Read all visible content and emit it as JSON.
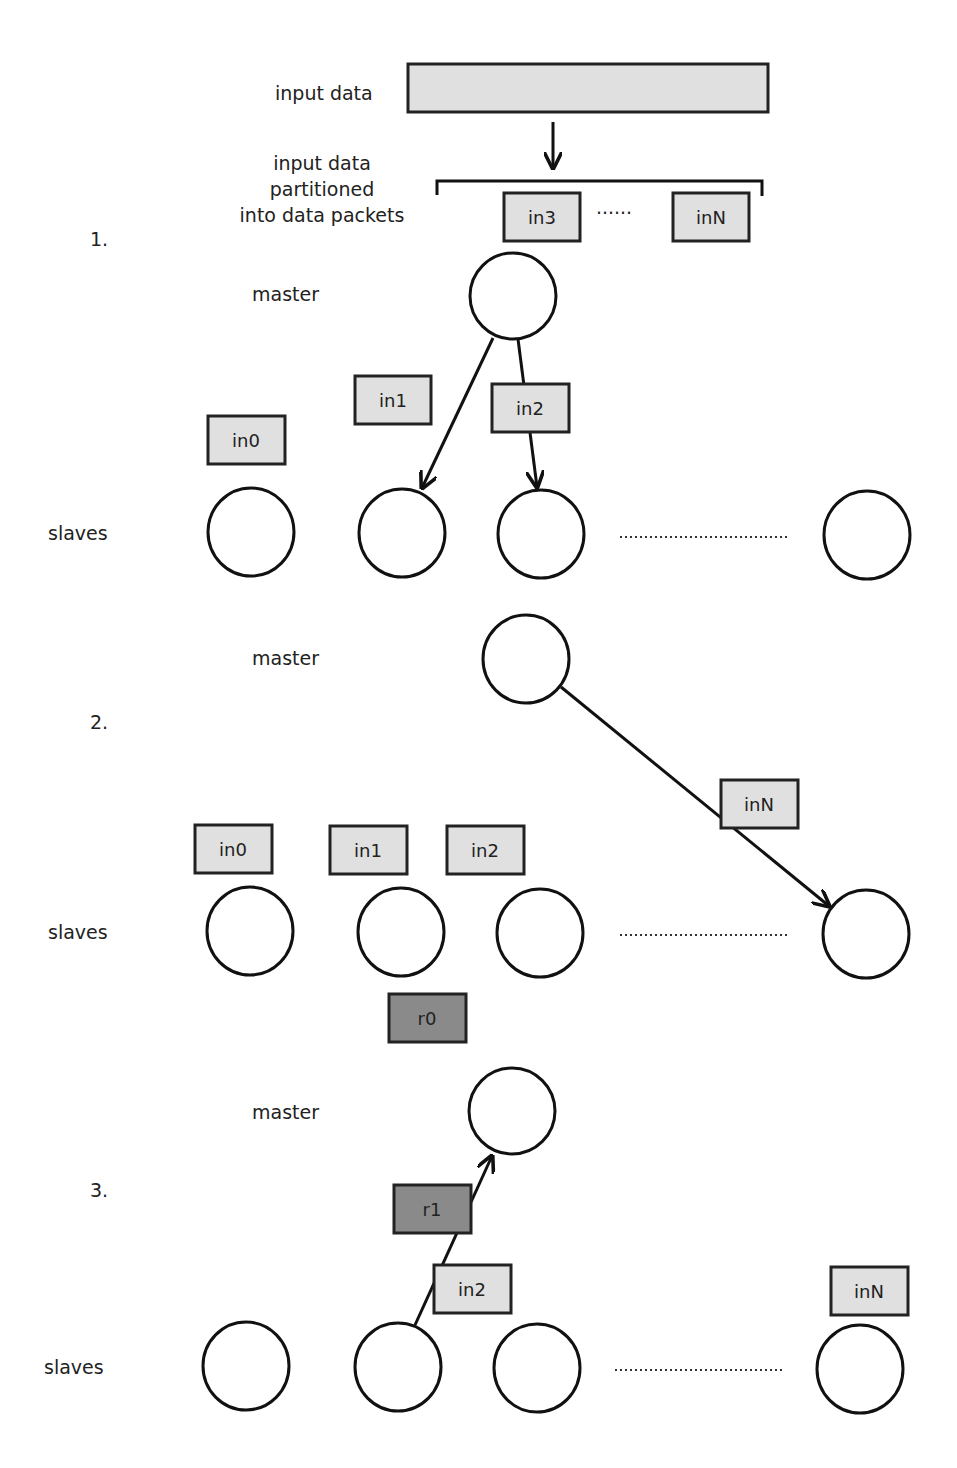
{
  "header": {
    "running_title": "master-slave"
  },
  "input": {
    "label": "input data",
    "partition_label_line1": "input data",
    "partition_label_line2": "partitioned",
    "partition_label_line3": "into data packets"
  },
  "colors": {
    "packet_fill": "#e0e0e0",
    "result_fill": "#8a8a8a",
    "stroke": "#222222"
  },
  "steps": [
    {
      "number": "1.",
      "master_label": "master",
      "slaves_label": "slaves",
      "queue_packets": [
        "in3",
        "inN"
      ],
      "queue_ellipsis": "......",
      "packets": [
        "in0",
        "in1",
        "in2"
      ]
    },
    {
      "number": "2.",
      "master_label": "master",
      "slaves_label": "slaves",
      "packets": [
        "in0",
        "in1",
        "in2",
        "inN"
      ]
    },
    {
      "number": "3.",
      "master_label": "master",
      "slaves_label": "slaves",
      "results": [
        "r0",
        "r1"
      ],
      "packets": [
        "in2",
        "inN"
      ]
    }
  ]
}
